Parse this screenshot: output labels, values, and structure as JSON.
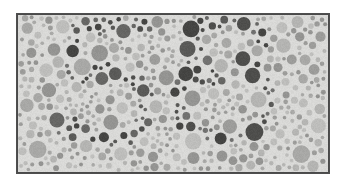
{
  "image": {
    "kind": "ishihara-plate",
    "description": "Grayscale pseudoisochromatic dot plate",
    "hidden_numeral": "56",
    "width": 345,
    "height": 187
  },
  "page": {
    "background_color": "#ffffff",
    "margin_left": 16,
    "margin_top": 13
  },
  "plate": {
    "x": 16,
    "y": 13,
    "width": 314,
    "height": 161,
    "border_width": 2,
    "border_color": "#4a4a4a",
    "field_color": "#d9d9d7",
    "shape": "rectangle"
  },
  "palette": {
    "field": "#d9d9d7",
    "background_dots": [
      "#a8a8a6",
      "#9c9c9a",
      "#b4b4b2",
      "#949492",
      "#bdbdbb"
    ],
    "figure_dots": [
      "#5a5a58",
      "#4e4e4c",
      "#666664",
      "#454543",
      "#717170"
    ],
    "border": "#4a4a4a",
    "page": "#ffffff"
  },
  "dots": {
    "radius_min": 1.8,
    "radius_max": 9.0,
    "gap": 0.9,
    "attempts": 9000,
    "seed": 20240517,
    "count_estimate": 900
  },
  "digits": [
    {
      "name": "digit-five",
      "value": "5",
      "stroke_width": 15,
      "bbox": {
        "x": 62,
        "y": 18,
        "width": 92,
        "height": 122
      },
      "strokes": [
        {
          "type": "line",
          "x1": 16,
          "y1": 10,
          "x2": 84,
          "y2": 7
        },
        {
          "type": "line",
          "x1": 16,
          "y1": 10,
          "x2": 11,
          "y2": 60
        },
        {
          "type": "line",
          "x1": 11,
          "y1": 60,
          "x2": 48,
          "y2": 53
        },
        {
          "type": "arc",
          "cx": 48,
          "cy": 88,
          "rx": 38,
          "ry": 35,
          "a0": -82,
          "a1": 150
        },
        {
          "type": "line",
          "x1": 14,
          "y1": 117,
          "x2": -4,
          "y2": 108
        }
      ]
    },
    {
      "name": "digit-six",
      "value": "6",
      "stroke_width": 15,
      "bbox": {
        "x": 172,
        "y": 16,
        "width": 104,
        "height": 126
      },
      "strokes": [
        {
          "type": "arc",
          "cx": 56,
          "cy": 44,
          "rx": 44,
          "ry": 40,
          "a0": 200,
          "a1": 330
        },
        {
          "type": "arc",
          "cx": 50,
          "cy": 80,
          "rx": 46,
          "ry": 44,
          "a0": 120,
          "a1": 250
        },
        {
          "type": "arc",
          "cx": 52,
          "cy": 82,
          "rx": 44,
          "ry": 40,
          "a0": -60,
          "a1": 250
        },
        {
          "type": "line",
          "x1": 8,
          "y1": 68,
          "x2": 50,
          "y2": 60
        }
      ]
    }
  ]
}
